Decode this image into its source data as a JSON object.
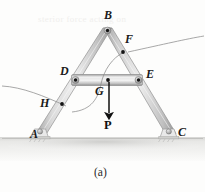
{
  "figure": {
    "caption": "(a)",
    "colors": {
      "member_light": "#e6e6e6",
      "member_mid": "#cfcfcf",
      "member_dark": "#a8a8a8",
      "member_edge": "#8e8e8e",
      "joint_pin": "#9a9a9a",
      "dot": "#1a1a1a",
      "ground": "#e3e3e1",
      "shadow": "#d2d2d0",
      "leader_line": "#8a8a8a",
      "arrow": "#111111",
      "background": "#fdfdfc",
      "label_text": "#1a1a1a"
    }
  },
  "joints": [
    {
      "id": "A",
      "label": "A",
      "x": 30,
      "y": 134,
      "dot_x": 39,
      "dot_y": 135,
      "show_dot": false
    },
    {
      "id": "B",
      "label": "B",
      "x": 104,
      "y": 12,
      "dot_x": 107,
      "dot_y": 31,
      "show_dot": true
    },
    {
      "id": "C",
      "label": "C",
      "x": 178,
      "y": 131,
      "dot_x": 169,
      "dot_y": 135,
      "show_dot": false
    },
    {
      "id": "D",
      "label": "D",
      "x": 61,
      "y": 70,
      "dot_x": 76,
      "dot_y": 80,
      "show_dot": true
    },
    {
      "id": "E",
      "label": "E",
      "x": 145,
      "y": 73,
      "dot_x": 138,
      "dot_y": 80,
      "show_dot": true
    },
    {
      "id": "F",
      "label": "F",
      "x": 124,
      "y": 37,
      "dot_x": 123,
      "dot_y": 52,
      "show_dot": true
    },
    {
      "id": "G",
      "label": "G",
      "x": 96,
      "y": 88,
      "dot_x": 108,
      "dot_y": 80,
      "show_dot": true
    },
    {
      "id": "H",
      "label": "H",
      "x": 41,
      "y": 100,
      "dot_x": 62,
      "dot_y": 104,
      "show_dot": true
    }
  ],
  "load": {
    "label": "P",
    "label_x": 104,
    "label_y": 120,
    "arrow_x": 109,
    "arrow_from_y": 82,
    "arrow_to_y": 115
  },
  "members": [
    {
      "name": "left-leg-B-to-A",
      "from": "B",
      "to": "A"
    },
    {
      "name": "right-leg-B-to-C",
      "from": "B",
      "to": "C"
    },
    {
      "name": "cross-brace-D-to-E",
      "from": "D",
      "to": "E"
    }
  ],
  "supports": [
    {
      "name": "support-A",
      "x": 39,
      "y": 136
    },
    {
      "name": "support-C",
      "x": 169,
      "y": 136
    }
  ],
  "leaders": [
    {
      "name": "leader-to-F",
      "target": "F"
    },
    {
      "name": "leader-to-H",
      "target": "H"
    },
    {
      "name": "leader-to-G",
      "target": "G"
    }
  ],
  "bleed_text": {
    "line1": "sterior force acting on"
  }
}
